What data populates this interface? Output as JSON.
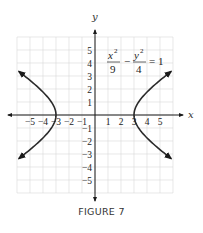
{
  "figure": {
    "caption": "FIGURE 7",
    "equation": {
      "term1_num": "x",
      "term1_exp": "2",
      "term1_den": "9",
      "operator": "−",
      "term2_num": "y",
      "term2_exp": "2",
      "term2_den": "4",
      "rhs": "= 1"
    },
    "colors": {
      "curve": "#2a2a2a",
      "axis": "#1a1a1a",
      "grid": "#d9d9d9",
      "text": "#222222"
    }
  },
  "chart_data": {
    "type": "line",
    "title": "",
    "equation": "x^2/9 - y^2/4 = 1",
    "xlabel": "x",
    "ylabel": "y",
    "xlim": [
      -6,
      6
    ],
    "ylim": [
      -6,
      6
    ],
    "grid": true,
    "x_ticks": [
      -5,
      -4,
      -3,
      -2,
      -1,
      1,
      2,
      3,
      4,
      5
    ],
    "x_tick_labels": [
      "−5",
      "−4",
      "−3",
      "−2",
      "−1",
      "1",
      "2",
      "3",
      "4",
      "5"
    ],
    "y_ticks": [
      5,
      4,
      3,
      2,
      1,
      -1,
      -2,
      -3,
      -4,
      -5
    ],
    "y_tick_labels": [
      "5",
      "4",
      "3",
      "2",
      "1",
      "−1",
      "−2",
      "−3",
      "−4",
      "−5"
    ],
    "series": [
      {
        "name": "right branch",
        "points": [
          [
            5.85,
            3.35
          ],
          [
            5,
            2.67
          ],
          [
            4,
            1.76
          ],
          [
            3.5,
            1.2
          ],
          [
            3.2,
            0.74
          ],
          [
            3,
            0
          ],
          [
            3.2,
            -0.74
          ],
          [
            3.5,
            -1.2
          ],
          [
            4,
            -1.76
          ],
          [
            5,
            -2.67
          ],
          [
            5.85,
            -3.35
          ]
        ],
        "arrows": "both-ends"
      },
      {
        "name": "left branch",
        "points": [
          [
            -5.85,
            3.35
          ],
          [
            -5,
            2.67
          ],
          [
            -4,
            1.76
          ],
          [
            -3.5,
            1.2
          ],
          [
            -3.2,
            0.74
          ],
          [
            -3,
            0
          ],
          [
            -3.2,
            -0.74
          ],
          [
            -3.5,
            -1.2
          ],
          [
            -4,
            -1.76
          ],
          [
            -5,
            -2.67
          ],
          [
            -5.85,
            -3.35
          ]
        ],
        "arrows": "both-ends"
      }
    ],
    "vertices": [
      [
        -3,
        0
      ],
      [
        3,
        0
      ]
    ]
  }
}
